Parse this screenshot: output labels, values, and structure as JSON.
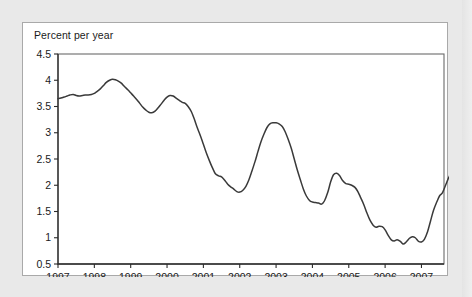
{
  "figure": {
    "axis_title": "Percent per year",
    "background_color": "#ffffff",
    "page_background_color": "#e9e9e9",
    "border_color": "#a9a9a9"
  },
  "chart_data": {
    "type": "line",
    "title": "Percent per year",
    "xlabel": "",
    "ylabel": "Percent per year",
    "xlim": [
      1997.0,
      2007.62
    ],
    "ylim": [
      0.5,
      4.5
    ],
    "ytick_labels": [
      "0.5",
      "1",
      "1.5",
      "2",
      "2.5",
      "3",
      "3.5",
      "4",
      "4.5"
    ],
    "ytick_values": [
      0.5,
      1,
      1.5,
      2,
      2.5,
      3,
      3.5,
      4,
      4.5
    ],
    "xtick_labels": [
      "1997",
      "1998",
      "1999",
      "2000",
      "2001",
      "2002",
      "2003",
      "2004",
      "2005",
      "2006",
      "2007"
    ],
    "xtick_values": [
      1997,
      1998,
      1999,
      2000,
      2001,
      2002,
      2003,
      2004,
      2005,
      2006,
      2007
    ],
    "grid": false,
    "legend": false,
    "line_color": "#3a3a3a",
    "series": [
      {
        "name": "Percent per year",
        "x": [
          1997.0,
          1997.08,
          1997.17,
          1997.25,
          1997.33,
          1997.42,
          1997.5,
          1997.58,
          1997.67,
          1997.75,
          1997.83,
          1997.92,
          1998.0,
          1998.08,
          1998.17,
          1998.25,
          1998.33,
          1998.42,
          1998.5,
          1998.58,
          1998.67,
          1998.75,
          1998.83,
          1998.92,
          1999.0,
          1999.08,
          1999.17,
          1999.25,
          1999.33,
          1999.42,
          1999.5,
          1999.58,
          1999.67,
          1999.75,
          1999.83,
          1999.92,
          2000.0,
          2000.08,
          2000.17,
          2000.25,
          2000.33,
          2000.42,
          2000.5,
          2000.58,
          2000.67,
          2000.75,
          2000.83,
          2000.92,
          2001.0,
          2001.08,
          2001.17,
          2001.25,
          2001.33,
          2001.42,
          2001.5,
          2001.58,
          2001.67,
          2001.75,
          2001.83,
          2001.92,
          2002.0,
          2002.08,
          2002.17,
          2002.25,
          2002.33,
          2002.42,
          2002.5,
          2002.58,
          2002.67,
          2002.75,
          2002.83,
          2002.92,
          2003.0,
          2003.08,
          2003.17,
          2003.25,
          2003.33,
          2003.42,
          2003.5,
          2003.58,
          2003.67,
          2003.75,
          2003.83,
          2003.92,
          2004.0,
          2004.08,
          2004.17,
          2004.25,
          2004.33,
          2004.42,
          2004.5,
          2004.58,
          2004.67,
          2004.75,
          2004.83,
          2004.92,
          2005.0,
          2005.08,
          2005.17,
          2005.25,
          2005.33,
          2005.42,
          2005.5,
          2005.58,
          2005.67,
          2005.75,
          2005.83,
          2005.92,
          2006.0,
          2006.08,
          2006.17,
          2006.25,
          2006.33,
          2006.42,
          2006.5,
          2006.58,
          2006.67,
          2006.75,
          2006.83,
          2006.92,
          2007.0,
          2007.08,
          2007.17,
          2007.25,
          2007.33,
          2007.42,
          2007.5,
          2007.58
        ],
        "y": [
          3.65,
          3.66,
          3.68,
          3.7,
          3.72,
          3.73,
          3.71,
          3.7,
          3.71,
          3.72,
          3.72,
          3.73,
          3.75,
          3.79,
          3.84,
          3.9,
          3.96,
          4.0,
          4.02,
          4.01,
          3.98,
          3.94,
          3.88,
          3.82,
          3.76,
          3.7,
          3.63,
          3.56,
          3.49,
          3.43,
          3.39,
          3.38,
          3.41,
          3.47,
          3.54,
          3.62,
          3.68,
          3.71,
          3.7,
          3.66,
          3.62,
          3.58,
          3.56,
          3.5,
          3.4,
          3.26,
          3.1,
          2.94,
          2.78,
          2.62,
          2.46,
          2.33,
          2.22,
          2.18,
          2.16,
          2.1,
          2.02,
          1.97,
          1.93,
          1.88,
          1.87,
          1.9,
          1.98,
          2.1,
          2.26,
          2.45,
          2.64,
          2.82,
          2.98,
          3.1,
          3.17,
          3.19,
          3.19,
          3.17,
          3.12,
          3.02,
          2.88,
          2.7,
          2.5,
          2.3,
          2.1,
          1.93,
          1.8,
          1.71,
          1.68,
          1.67,
          1.66,
          1.64,
          1.7,
          1.86,
          2.06,
          2.2,
          2.23,
          2.18,
          2.09,
          2.03,
          2.02,
          2.0,
          1.96,
          1.88,
          1.76,
          1.62,
          1.47,
          1.34,
          1.24,
          1.2,
          1.22,
          1.21,
          1.15,
          1.05,
          0.96,
          0.94,
          0.96,
          0.93,
          0.88,
          0.92,
          0.99,
          1.02,
          1.0,
          0.93,
          0.92,
          0.97,
          1.12,
          1.32,
          1.52,
          1.68,
          1.8,
          1.86
        ],
        "y_tail": [
          2.0,
          2.14,
          2.26,
          2.35
        ]
      }
    ],
    "annotations": []
  }
}
